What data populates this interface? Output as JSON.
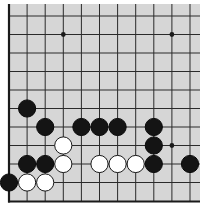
{
  "board": {
    "title": "Go board position (partial, lower-left region)",
    "background_color": "#d6d6d6",
    "line_color": "#2a2a2a",
    "edge_color": "#1a1a1a",
    "origin_x": 9,
    "origin_y": 16,
    "spacing_x": 18.1,
    "spacing_y": 18.5,
    "columns": 11,
    "rows": 11,
    "left_edge": true,
    "bottom_edge": true,
    "stone_radius": 8.6
  },
  "star_points": [
    {
      "col": 3,
      "row": 1
    },
    {
      "col": 9,
      "row": 1
    },
    {
      "col": 9,
      "row": 7
    }
  ],
  "stones": [
    {
      "color": "black",
      "col": 1,
      "row": 5
    },
    {
      "color": "black",
      "col": 2,
      "row": 6
    },
    {
      "color": "black",
      "col": 4,
      "row": 6
    },
    {
      "color": "black",
      "col": 5,
      "row": 6
    },
    {
      "color": "black",
      "col": 6,
      "row": 6
    },
    {
      "color": "black",
      "col": 8,
      "row": 6
    },
    {
      "color": "white",
      "col": 3,
      "row": 7
    },
    {
      "color": "black",
      "col": 8,
      "row": 7
    },
    {
      "color": "black",
      "col": 1,
      "row": 8
    },
    {
      "color": "black",
      "col": 2,
      "row": 8
    },
    {
      "color": "white",
      "col": 3,
      "row": 8
    },
    {
      "color": "white",
      "col": 5,
      "row": 8
    },
    {
      "color": "white",
      "col": 6,
      "row": 8
    },
    {
      "color": "white",
      "col": 7,
      "row": 8
    },
    {
      "color": "black",
      "col": 8,
      "row": 8
    },
    {
      "color": "black",
      "col": 10,
      "row": 8
    },
    {
      "color": "black",
      "col": 0,
      "row": 9
    },
    {
      "color": "white",
      "col": 1,
      "row": 9
    },
    {
      "color": "white",
      "col": 2,
      "row": 9
    }
  ]
}
